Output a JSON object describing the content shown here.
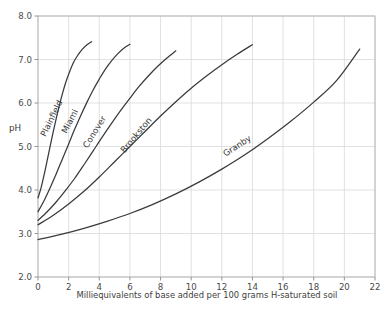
{
  "chart_data": {
    "type": "line",
    "title": "",
    "xlabel": "Milliequivalents of base added per 100 grams H-saturated soil",
    "ylabel": "pH",
    "xlim": [
      0,
      22
    ],
    "ylim": [
      2.0,
      8.0
    ],
    "xticks": [
      0,
      2,
      4,
      6,
      8,
      10,
      12,
      14,
      16,
      18,
      20,
      22
    ],
    "xtick_labels": [
      "0",
      "2",
      "4",
      "6",
      "8",
      "10",
      "12",
      "14",
      "16",
      "18",
      "20",
      "22"
    ],
    "yticks": [
      2.0,
      3.0,
      4.0,
      5.0,
      6.0,
      7.0,
      8.0
    ],
    "ytick_labels": [
      "2.0",
      "3.0",
      "4.0",
      "5.0",
      "6.0",
      "7.0",
      "8.0"
    ],
    "grid": true,
    "legend_position": "inline-curve-labels",
    "line_color": "#3a3a3a",
    "grid_color": "#d9d9d9",
    "background_color": "#ffffff",
    "series": [
      {
        "name": "Plainfield",
        "label": "Plainfield",
        "label_x": 1.05,
        "label_y": 5.62,
        "label_rotation": -64,
        "points": [
          [
            0.0,
            3.82
          ],
          [
            0.2,
            4.05
          ],
          [
            0.4,
            4.35
          ],
          [
            0.6,
            4.68
          ],
          [
            0.8,
            5.02
          ],
          [
            1.0,
            5.35
          ],
          [
            1.2,
            5.66
          ],
          [
            1.4,
            5.95
          ],
          [
            1.6,
            6.22
          ],
          [
            1.8,
            6.46
          ],
          [
            2.0,
            6.66
          ],
          [
            2.3,
            6.92
          ],
          [
            2.6,
            7.1
          ],
          [
            2.9,
            7.24
          ],
          [
            3.2,
            7.34
          ],
          [
            3.5,
            7.41
          ]
        ]
      },
      {
        "name": "Miami",
        "label": "Miami",
        "label_x": 2.25,
        "label_y": 5.55,
        "label_rotation": -63,
        "points": [
          [
            0.0,
            3.5
          ],
          [
            0.4,
            3.76
          ],
          [
            0.8,
            4.06
          ],
          [
            1.2,
            4.38
          ],
          [
            1.6,
            4.72
          ],
          [
            2.0,
            5.06
          ],
          [
            2.4,
            5.4
          ],
          [
            2.8,
            5.72
          ],
          [
            3.2,
            6.02
          ],
          [
            3.6,
            6.3
          ],
          [
            4.0,
            6.55
          ],
          [
            4.4,
            6.78
          ],
          [
            4.8,
            6.97
          ],
          [
            5.2,
            7.13
          ],
          [
            5.6,
            7.26
          ],
          [
            6.0,
            7.35
          ]
        ]
      },
      {
        "name": "Conover",
        "label": "Conover",
        "label_x": 3.85,
        "label_y": 5.3,
        "label_rotation": -58,
        "points": [
          [
            0.0,
            3.3
          ],
          [
            0.6,
            3.5
          ],
          [
            1.2,
            3.73
          ],
          [
            1.8,
            3.99
          ],
          [
            2.4,
            4.27
          ],
          [
            3.0,
            4.58
          ],
          [
            3.6,
            4.9
          ],
          [
            4.2,
            5.22
          ],
          [
            4.8,
            5.53
          ],
          [
            5.4,
            5.83
          ],
          [
            6.0,
            6.11
          ],
          [
            6.6,
            6.38
          ],
          [
            7.2,
            6.62
          ],
          [
            7.8,
            6.84
          ],
          [
            8.4,
            7.03
          ],
          [
            9.0,
            7.2
          ]
        ]
      },
      {
        "name": "Brookston",
        "label": "Brookston",
        "label_x": 6.55,
        "label_y": 5.22,
        "label_rotation": -50,
        "points": [
          [
            0.0,
            3.2
          ],
          [
            1.0,
            3.42
          ],
          [
            2.0,
            3.68
          ],
          [
            3.0,
            3.97
          ],
          [
            4.0,
            4.3
          ],
          [
            5.0,
            4.65
          ],
          [
            6.0,
            5.0
          ],
          [
            7.0,
            5.35
          ],
          [
            8.0,
            5.7
          ],
          [
            9.0,
            6.03
          ],
          [
            10.0,
            6.34
          ],
          [
            11.0,
            6.62
          ],
          [
            12.0,
            6.88
          ],
          [
            13.0,
            7.12
          ],
          [
            14.0,
            7.34
          ]
        ]
      },
      {
        "name": "Granby",
        "label": "Granby",
        "label_x": 13.1,
        "label_y": 4.96,
        "label_rotation": -33,
        "points": [
          [
            0.0,
            2.86
          ],
          [
            1.5,
            2.98
          ],
          [
            3.0,
            3.12
          ],
          [
            4.5,
            3.28
          ],
          [
            6.0,
            3.46
          ],
          [
            7.5,
            3.67
          ],
          [
            9.0,
            3.91
          ],
          [
            10.5,
            4.18
          ],
          [
            12.0,
            4.48
          ],
          [
            13.5,
            4.81
          ],
          [
            15.0,
            5.18
          ],
          [
            16.5,
            5.58
          ],
          [
            18.0,
            6.02
          ],
          [
            19.5,
            6.52
          ],
          [
            21.0,
            7.24
          ]
        ]
      }
    ]
  }
}
